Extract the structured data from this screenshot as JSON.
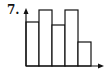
{
  "problem_label": "7.",
  "chart_data": {
    "type": "bar",
    "title": "",
    "xlabel": "",
    "ylabel": "",
    "categories": [
      "1",
      "2",
      "3",
      "4",
      "5"
    ],
    "values": [
      44,
      56,
      41,
      56,
      24
    ],
    "bar_adjacent": true,
    "grid": false,
    "legend": null,
    "ylim": [
      0,
      60
    ],
    "axis_arrows": true,
    "tick_labels_shown": false
  },
  "colors": {
    "stroke": "#111111",
    "fill": "#ffffff"
  }
}
